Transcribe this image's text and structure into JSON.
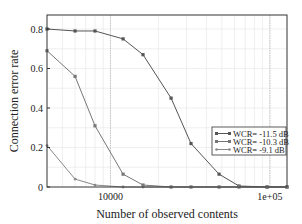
{
  "chart_data": {
    "type": "line",
    "title": "",
    "xlabel": "Number of observed contents",
    "ylabel": "Connection error rate",
    "xscale": "log",
    "x": [
      4000,
      6000,
      8000,
      12000,
      16000,
      24000,
      32000,
      48000,
      64000,
      96000,
      128000
    ],
    "xlim": [
      4000,
      128000
    ],
    "ylim": [
      0,
      0.85
    ],
    "x_ticks": [
      {
        "value": 10000,
        "label": "10000"
      },
      {
        "value": 100000,
        "label": "1e+05"
      }
    ],
    "y_ticks": [
      {
        "value": 0,
        "label": "0"
      },
      {
        "value": 0.2,
        "label": "0.2"
      },
      {
        "value": 0.4,
        "label": "0.4"
      },
      {
        "value": 0.6,
        "label": "0.6"
      },
      {
        "value": 0.8,
        "label": "0.8"
      }
    ],
    "grid": true,
    "legend_position": "center-right",
    "series": [
      {
        "name": "WCR= -11.5 dB",
        "marker": "square",
        "values": [
          0.8,
          0.79,
          0.79,
          0.75,
          0.67,
          0.45,
          0.22,
          0.065,
          0.005,
          0.0,
          0.0
        ]
      },
      {
        "name": "WCR= -10.3 dB",
        "marker": "square",
        "values": [
          0.69,
          0.56,
          0.31,
          0.065,
          0.01,
          0.0,
          0.0,
          0.0,
          0.0,
          0.0,
          0.0
        ]
      },
      {
        "name": "WCR= -9.1 dB",
        "marker": "dot",
        "values": [
          0.21,
          0.04,
          0.01,
          0.0,
          0.0,
          0.0,
          0.0,
          0.0,
          0.0,
          0.0,
          0.0
        ]
      }
    ]
  },
  "colors": {
    "series": [
      "#555555",
      "#777777",
      "#888888"
    ],
    "axis": "#333333",
    "grid": "#e4e4e4",
    "refline": "#bbbbbb"
  }
}
